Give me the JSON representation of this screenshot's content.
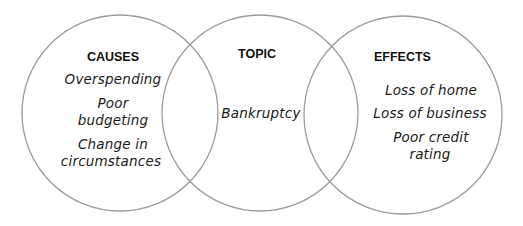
{
  "diagram": {
    "type": "venn",
    "line_color": "#9a9a9a",
    "circles": [
      {
        "id": "causes",
        "cx": 120,
        "cy": 113,
        "r": 98
      },
      {
        "id": "topic",
        "cx": 260,
        "cy": 113,
        "r": 98
      },
      {
        "id": "effects",
        "cx": 403,
        "cy": 115,
        "r": 99
      }
    ],
    "causes": {
      "heading": "CAUSES",
      "items": [
        {
          "lines": [
            "Overspending"
          ]
        },
        {
          "lines": [
            "Poor",
            "budgeting"
          ]
        },
        {
          "lines": [
            "Change in",
            "circumstances"
          ]
        }
      ]
    },
    "topic": {
      "heading": "TOPIC",
      "items": [
        {
          "lines": [
            "Bankruptcy"
          ]
        }
      ]
    },
    "effects": {
      "heading": "EFFECTS",
      "items": [
        {
          "lines": [
            "Loss of home"
          ]
        },
        {
          "lines": [
            "Loss of business"
          ]
        },
        {
          "lines": [
            "Poor credit",
            "rating"
          ]
        }
      ]
    }
  }
}
